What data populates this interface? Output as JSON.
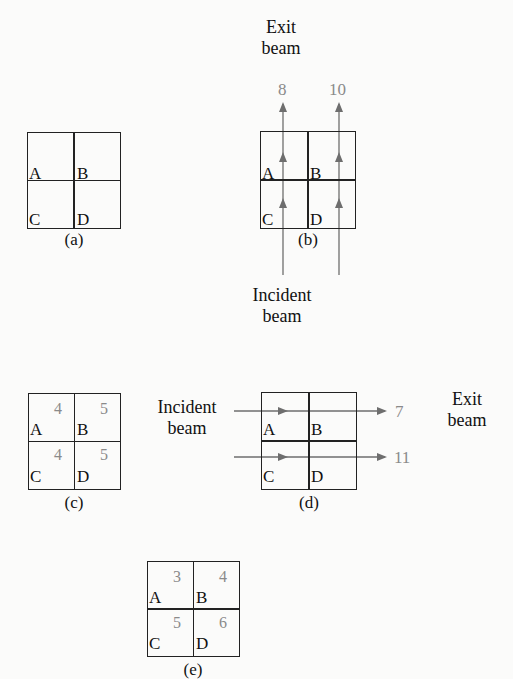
{
  "figure": {
    "panels": [
      {
        "id": "a",
        "caption": "(a)",
        "cells": [
          {
            "label": "A",
            "value": ""
          },
          {
            "label": "B",
            "value": ""
          },
          {
            "label": "C",
            "value": ""
          },
          {
            "label": "D",
            "value": ""
          }
        ]
      },
      {
        "id": "b",
        "caption": "(b)",
        "cells": [
          {
            "label": "A"
          },
          {
            "label": "B"
          },
          {
            "label": "C"
          },
          {
            "label": "D"
          }
        ],
        "beam_direction": "vertical (bottom to top)",
        "incident_label": "Incident beam",
        "incident_lines": [
          "Incident",
          "beam"
        ],
        "exit_label": "Exit beam",
        "exit_lines": [
          "Exit",
          "beam"
        ],
        "exit_values": [
          "8",
          "10"
        ]
      },
      {
        "id": "c",
        "caption": "(c)",
        "cells": [
          {
            "label": "A",
            "value": "4"
          },
          {
            "label": "B",
            "value": "5"
          },
          {
            "label": "C",
            "value": "4"
          },
          {
            "label": "D",
            "value": "5"
          }
        ]
      },
      {
        "id": "d",
        "caption": "(d)",
        "cells": [
          {
            "label": "A"
          },
          {
            "label": "B"
          },
          {
            "label": "C"
          },
          {
            "label": "D"
          }
        ],
        "beam_direction": "horizontal (left to right)",
        "incident_label": "Incident beam",
        "incident_lines": [
          "Incident",
          "beam"
        ],
        "exit_label": "Exit beam",
        "exit_lines": [
          "Exit",
          "beam"
        ],
        "exit_values": [
          "7",
          "11"
        ]
      },
      {
        "id": "e",
        "caption": "(e)",
        "cells": [
          {
            "label": "A",
            "value": "3"
          },
          {
            "label": "B",
            "value": "4"
          },
          {
            "label": "C",
            "value": "5"
          },
          {
            "label": "D",
            "value": "6"
          }
        ]
      }
    ],
    "colors": {
      "line": "#222222",
      "arrow": "#6e6e6e",
      "value_text": "#8a8a8a",
      "background": "#fbfbfa"
    }
  }
}
